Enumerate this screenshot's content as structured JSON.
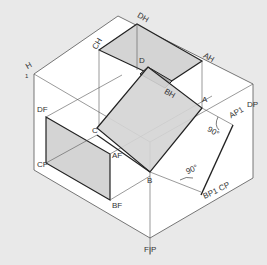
{
  "figure": {
    "colors": {
      "background": "#e9e9e9",
      "box_face": "#ffffff",
      "shaded_face": "#d4d4d4",
      "dark_face": "#b0b0b0",
      "line": "#222222",
      "thin_line": "#555555"
    },
    "plane_labels": {
      "H": "H",
      "one": "1",
      "DP": "DP",
      "FP": "F|P"
    },
    "point_labels": {
      "CH": "CH",
      "DH": "DH",
      "AH": "AH",
      "D": "D",
      "BH": "BH",
      "A": "A",
      "C": "C",
      "B": "B",
      "DF": "DF",
      "CF": "CF",
      "AF": "AF",
      "BF": "BF",
      "AP1": "AP1",
      "BP1": "BP1",
      "CP": "CP"
    },
    "angles": [
      "90°",
      "90°"
    ]
  }
}
